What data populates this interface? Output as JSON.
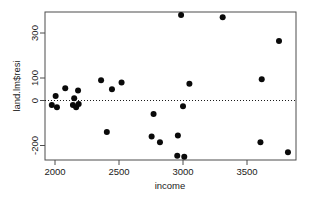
{
  "chart_data": {
    "type": "scatter",
    "title": "",
    "xlabel": "income",
    "ylabel": "land.lm$resi",
    "xlim": [
      1930,
      3870
    ],
    "ylim": [
      -290,
      400
    ],
    "xticks": [
      2000,
      2500,
      3000,
      3500
    ],
    "xticklabels": [
      "2000",
      "2500",
      "3000",
      "3500"
    ],
    "yticks": [
      -200,
      0,
      100,
      300
    ],
    "yticklabels": [
      "-200",
      "0",
      "100",
      "300"
    ],
    "grid": false,
    "legend": null,
    "reference_line": {
      "orientation": "horizontal",
      "y": 0,
      "style": "dotted"
    },
    "marker": {
      "shape": "circle",
      "color": "#0a0a0a",
      "size": 3
    },
    "points": [
      {
        "x": 1975,
        "y": -20
      },
      {
        "x": 2005,
        "y": 20
      },
      {
        "x": 2015,
        "y": -30
      },
      {
        "x": 2080,
        "y": 55
      },
      {
        "x": 2140,
        "y": -20
      },
      {
        "x": 2150,
        "y": 10
      },
      {
        "x": 2165,
        "y": -30
      },
      {
        "x": 2180,
        "y": 45
      },
      {
        "x": 2185,
        "y": -15
      },
      {
        "x": 2360,
        "y": 90
      },
      {
        "x": 2405,
        "y": -140
      },
      {
        "x": 2445,
        "y": 50
      },
      {
        "x": 2520,
        "y": 80
      },
      {
        "x": 2755,
        "y": -160
      },
      {
        "x": 2770,
        "y": -60
      },
      {
        "x": 2820,
        "y": -185
      },
      {
        "x": 2955,
        "y": -245
      },
      {
        "x": 2960,
        "y": -155
      },
      {
        "x": 2985,
        "y": 380
      },
      {
        "x": 3000,
        "y": -25
      },
      {
        "x": 3010,
        "y": -250
      },
      {
        "x": 3050,
        "y": 75
      },
      {
        "x": 3310,
        "y": 370
      },
      {
        "x": 3605,
        "y": -185
      },
      {
        "x": 3615,
        "y": 95
      },
      {
        "x": 3750,
        "y": 265
      },
      {
        "x": 3820,
        "y": -230
      }
    ]
  },
  "axes_geometry": {
    "plot_left_px": 45,
    "plot_right_px": 296,
    "plot_top_px": 12,
    "plot_bottom_px": 160,
    "x_origin_px": 55,
    "x_scale_px_per_unit": 0.128,
    "y_zero_px": 100.5,
    "y_scale_px_per_unit": 0.225
  }
}
